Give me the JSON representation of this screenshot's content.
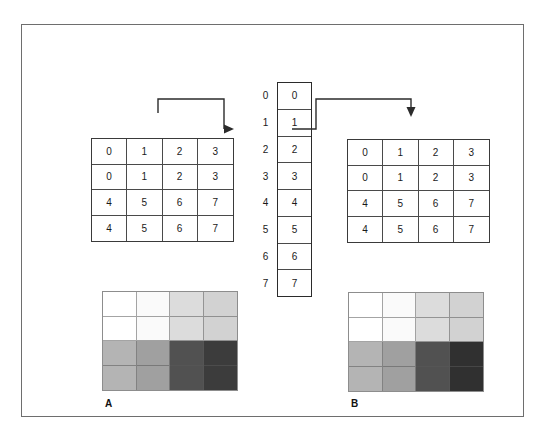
{
  "figure": {
    "frame_color": "#6e6e6e",
    "background": "#ffffff"
  },
  "tables": {
    "left": {
      "name": "input-pixel-values",
      "rows": [
        [
          "0",
          "1",
          "2",
          "3"
        ],
        [
          "0",
          "1",
          "2",
          "3"
        ],
        [
          "4",
          "5",
          "6",
          "7"
        ],
        [
          "4",
          "5",
          "6",
          "7"
        ]
      ]
    },
    "right": {
      "name": "output-pixel-values",
      "rows": [
        [
          "0",
          "1",
          "2",
          "3"
        ],
        [
          "0",
          "1",
          "2",
          "3"
        ],
        [
          "4",
          "5",
          "6",
          "7"
        ],
        [
          "4",
          "5",
          "6",
          "7"
        ]
      ]
    }
  },
  "lut": {
    "indices": [
      "0",
      "1",
      "2",
      "3",
      "4",
      "5",
      "6",
      "7"
    ],
    "values": [
      "0",
      "1",
      "2",
      "3",
      "4",
      "5",
      "6",
      "7"
    ],
    "highlighted_index": "2"
  },
  "arrows": {
    "left": {
      "label": "input value 2 indexes the LUT",
      "direction": "right"
    },
    "right": {
      "label": "LUT output 2 written to output image",
      "direction": "down"
    }
  },
  "gray_images": {
    "a": {
      "label": "A",
      "caption": "A",
      "rows": [
        [
          "#ffffff",
          "#fafafa",
          "#dcdcdc",
          "#d2d2d2"
        ],
        [
          "#ffffff",
          "#fafafa",
          "#dcdcdc",
          "#d2d2d2"
        ],
        [
          "#b4b4b4",
          "#a0a0a0",
          "#515151",
          "#3c3c3c"
        ],
        [
          "#b4b4b4",
          "#a0a0a0",
          "#515151",
          "#3c3c3c"
        ]
      ]
    },
    "b": {
      "label": "B",
      "caption": "B",
      "rows": [
        [
          "#ffffff",
          "#fafafa",
          "#dcdcdc",
          "#d2d2d2"
        ],
        [
          "#ffffff",
          "#fafafa",
          "#dcdcdc",
          "#d2d2d2"
        ],
        [
          "#b4b4b4",
          "#a0a0a0",
          "#515151",
          "#303030"
        ],
        [
          "#b4b4b4",
          "#a0a0a0",
          "#515151",
          "#303030"
        ]
      ]
    }
  },
  "colors": {
    "line": "#2b2b2b",
    "cell_border": "#4a4a4a",
    "text": "#1a1a1a"
  }
}
